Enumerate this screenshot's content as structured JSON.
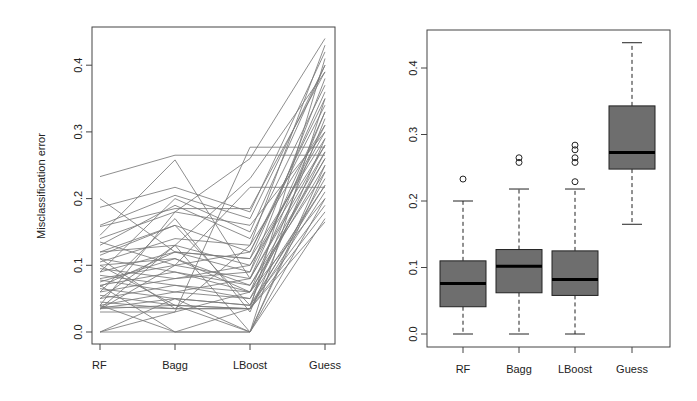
{
  "chart_data": [
    {
      "type": "line",
      "title": "",
      "xlabel": "",
      "ylabel": "Misclassification error",
      "categories": [
        "RF",
        "Bagg",
        "LBoost",
        "Guess"
      ],
      "ylim": [
        0,
        0.44
      ],
      "yticks": [
        "0.0",
        "0.1",
        "0.2",
        "0.3",
        "0.4"
      ],
      "grid": false,
      "description": "Parallel-coordinate plot: each line is one dataset's misclassification error across the four methods",
      "series": [
        {
          "name": "s1",
          "values": [
            0.233,
            0.265,
            0.265,
            0.265
          ]
        },
        {
          "name": "s2",
          "values": [
            0.2,
            0.12,
            0.11,
            0.36
          ]
        },
        {
          "name": "s3",
          "values": [
            0.187,
            0.217,
            0.18,
            0.42
          ]
        },
        {
          "name": "s4",
          "values": [
            0.16,
            0.205,
            0.17,
            0.4
          ]
        },
        {
          "name": "s5",
          "values": [
            0.158,
            0.185,
            0.185,
            0.39
          ]
        },
        {
          "name": "s6",
          "values": [
            0.145,
            0.258,
            0.08,
            0.33
          ]
        },
        {
          "name": "s7",
          "values": [
            0.14,
            0.18,
            0.16,
            0.3
          ]
        },
        {
          "name": "s8",
          "values": [
            0.135,
            0.1,
            0.217,
            0.217
          ]
        },
        {
          "name": "s9",
          "values": [
            0.13,
            0.19,
            0.14,
            0.37
          ]
        },
        {
          "name": "s10",
          "values": [
            0.12,
            0.13,
            0.1,
            0.28
          ]
        },
        {
          "name": "s11",
          "values": [
            0.115,
            0.16,
            0.12,
            0.34
          ]
        },
        {
          "name": "s12",
          "values": [
            0.11,
            0.09,
            0.07,
            0.26
          ]
        },
        {
          "name": "s13",
          "values": [
            0.105,
            0.14,
            0.13,
            0.43
          ]
        },
        {
          "name": "s14",
          "values": [
            0.1,
            0.11,
            0.06,
            0.25
          ]
        },
        {
          "name": "s15",
          "values": [
            0.095,
            0.08,
            0.09,
            0.31
          ]
        },
        {
          "name": "s16",
          "values": [
            0.09,
            0.12,
            0.11,
            0.29
          ]
        },
        {
          "name": "s17",
          "values": [
            0.085,
            0.07,
            0.05,
            0.22
          ]
        },
        {
          "name": "s18",
          "values": [
            0.08,
            0.1,
            0.12,
            0.35
          ]
        },
        {
          "name": "s19",
          "values": [
            0.078,
            0.06,
            0.08,
            0.27
          ]
        },
        {
          "name": "s20",
          "values": [
            0.075,
            0.11,
            0.07,
            0.24
          ]
        },
        {
          "name": "s21",
          "values": [
            0.07,
            0.09,
            0.06,
            0.2
          ]
        },
        {
          "name": "s22",
          "values": [
            0.068,
            0.12,
            0.09,
            0.38
          ]
        },
        {
          "name": "s23",
          "values": [
            0.065,
            0.05,
            0.04,
            0.19
          ]
        },
        {
          "name": "s24",
          "values": [
            0.06,
            0.08,
            0.1,
            0.3
          ]
        },
        {
          "name": "s25",
          "values": [
            0.055,
            0.04,
            0.035,
            0.23
          ]
        },
        {
          "name": "s26",
          "values": [
            0.05,
            0.07,
            0.06,
            0.26
          ]
        },
        {
          "name": "s27",
          "values": [
            0.045,
            0.035,
            0.035,
            0.18
          ]
        },
        {
          "name": "s28",
          "values": [
            0.04,
            0.06,
            0.05,
            0.27
          ]
        },
        {
          "name": "s29",
          "values": [
            0.038,
            0.035,
            0.035,
            0.21
          ]
        },
        {
          "name": "s30",
          "values": [
            0.036,
            0.05,
            0.04,
            0.32
          ]
        },
        {
          "name": "s31",
          "values": [
            0.035,
            0.04,
            0.035,
            0.165
          ]
        },
        {
          "name": "s32",
          "values": [
            0.034,
            0.1,
            0.08,
            0.28
          ]
        },
        {
          "name": "s33",
          "values": [
            0.0,
            0.0,
            0.0,
            0.17
          ]
        },
        {
          "name": "s34",
          "values": [
            0.0,
            0.05,
            0.0,
            0.24
          ]
        },
        {
          "name": "s35",
          "values": [
            0.0,
            0.03,
            0.06,
            0.33
          ]
        },
        {
          "name": "s36",
          "values": [
            0.04,
            0.0,
            0.0,
            0.2
          ]
        },
        {
          "name": "s37",
          "values": [
            0.07,
            0.0,
            0.035,
            0.41
          ]
        },
        {
          "name": "s38",
          "values": [
            0.1,
            0.04,
            0.0,
            0.25
          ]
        },
        {
          "name": "s39",
          "values": [
            0.035,
            0.13,
            0.0,
            0.35
          ]
        },
        {
          "name": "s40",
          "values": [
            0.06,
            0.17,
            0.03,
            0.29
          ]
        },
        {
          "name": "s41",
          "values": [
            0.11,
            0.035,
            0.13,
            0.31
          ]
        },
        {
          "name": "s42",
          "values": [
            0.04,
            0.18,
            0.26,
            0.44
          ]
        },
        {
          "name": "s43",
          "values": [
            0.03,
            0.03,
            0.277,
            0.277
          ]
        },
        {
          "name": "s44",
          "values": [
            0.05,
            0.13,
            0.23,
            0.39
          ]
        },
        {
          "name": "s45",
          "values": [
            0.12,
            0.16,
            0.04,
            0.22
          ]
        },
        {
          "name": "s46",
          "values": [
            0.09,
            0.2,
            0.15,
            0.4
          ]
        }
      ]
    },
    {
      "type": "box",
      "title": "",
      "xlabel": "",
      "ylabel": "",
      "categories": [
        "RF",
        "Bagg",
        "LBoost",
        "Guess"
      ],
      "ylim": [
        0,
        0.44
      ],
      "yticks": [
        "0.0",
        "0.1",
        "0.2",
        "0.3",
        "0.4"
      ],
      "grid": false,
      "boxes": [
        {
          "label": "RF",
          "whisker_low": 0.0,
          "q1": 0.041,
          "median": 0.076,
          "q3": 0.11,
          "whisker_high": 0.2,
          "outliers": [
            0.233
          ]
        },
        {
          "label": "Bagg",
          "whisker_low": 0.0,
          "q1": 0.062,
          "median": 0.102,
          "q3": 0.127,
          "whisker_high": 0.218,
          "outliers": [
            0.258,
            0.265
          ]
        },
        {
          "label": "LBoost",
          "whisker_low": 0.0,
          "q1": 0.058,
          "median": 0.082,
          "q3": 0.125,
          "whisker_high": 0.218,
          "outliers": [
            0.229,
            0.258,
            0.265,
            0.277,
            0.284
          ]
        },
        {
          "label": "Guess",
          "whisker_low": 0.165,
          "q1": 0.248,
          "median": 0.273,
          "q3": 0.343,
          "whisker_high": 0.438,
          "outliers": []
        }
      ],
      "box_fill": "#6e6e6e",
      "median_color": "#000000"
    }
  ],
  "colors": {
    "line": "#7a7a7a",
    "box_fill": "#6e6e6e",
    "median": "#000000",
    "axis": "#333333"
  }
}
